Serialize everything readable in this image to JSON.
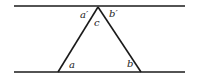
{
  "diagram": {
    "colors": {
      "line": "#1a1a1a",
      "text": "#222222",
      "background": "#ffffff"
    },
    "lines": {
      "top": {
        "x1": 14,
        "y1": 6,
        "x2": 185,
        "y2": 6
      },
      "bottom": {
        "x1": 14,
        "y1": 72,
        "x2": 185,
        "y2": 72
      }
    },
    "triangle": {
      "apex": {
        "x": 98,
        "y": 7
      },
      "left": {
        "x": 58,
        "y": 72
      },
      "right": {
        "x": 141,
        "y": 72
      }
    },
    "labels": {
      "a_prime": "a′",
      "b_prime": "b′",
      "c": "c",
      "a": "a",
      "b": "b"
    }
  }
}
